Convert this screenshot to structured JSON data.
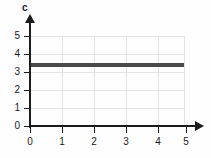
{
  "chart_data": {
    "type": "line",
    "title": "",
    "subtitle": "",
    "xlabel": "",
    "ylabel": "c",
    "xlim": [
      0,
      5
    ],
    "ylim": [
      0,
      5
    ],
    "grid": true,
    "legend": null,
    "x_ticks": [
      "0",
      "1",
      "2",
      "3",
      "4",
      "5"
    ],
    "y_ticks": [
      "0",
      "1",
      "2",
      "3",
      "4",
      "5"
    ],
    "series": [
      {
        "name": "c",
        "x": [
          0,
          4.8
        ],
        "values": [
          3.4,
          3.4
        ],
        "color": "#4a4a4a",
        "style": "solid",
        "width": 4
      }
    ],
    "annotations": []
  },
  "axes": {
    "y_label": "c",
    "x_arrow": "arrow-right",
    "y_arrow": "arrow-up"
  },
  "colors": {
    "series": "#4a4a4a",
    "grid": "#e3e3e3",
    "axis": "#1c1c1c",
    "background": "#fefefe",
    "text": "#1a1a1a"
  }
}
